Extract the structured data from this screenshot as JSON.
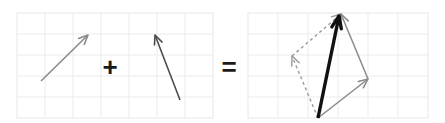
{
  "figure": {
    "background_color": "#ffffff",
    "width": 445,
    "height": 123
  },
  "style": {
    "grid_line_color": "#e8eced",
    "grid_border_color": "#e3e8ea",
    "vector_gray": "#8a8a8a",
    "vector_dark_gray": "#4d4d4d",
    "resultant_black": "#111111",
    "dashed_gray": "#9a9a9a",
    "operator_color": "#1a1a1a"
  },
  "operators": {
    "plus": {
      "label": "+",
      "x": 110,
      "y": 67,
      "font_size": 26
    },
    "equals": {
      "label": "=",
      "x": 229,
      "y": 67,
      "font_size": 26
    }
  },
  "left_panel": {
    "name": "operand-grid",
    "grid": {
      "x": 17,
      "y": 13,
      "width": 196,
      "height": 105,
      "cols": 7,
      "rows": 5,
      "cell_width": 28,
      "cell_height": 21
    },
    "vectors": [
      {
        "id": "vector-a",
        "label": "a",
        "color": "#8a8a8a",
        "stroke_width": 1.6,
        "tail": {
          "x": 41,
          "y": 81
        },
        "tip": {
          "x": 88,
          "y": 35
        },
        "components": {
          "dx": 47,
          "dy": -46
        }
      },
      {
        "id": "vector-b",
        "label": "b",
        "color": "#4d4d4d",
        "stroke_width": 1.6,
        "tail": {
          "x": 180,
          "y": 100
        },
        "tip": {
          "x": 155,
          "y": 35
        },
        "components": {
          "dx": -25,
          "dy": -65
        }
      }
    ]
  },
  "right_panel": {
    "name": "resultant-grid",
    "grid": {
      "x": 248,
      "y": 13,
      "width": 180,
      "height": 105,
      "cols": 6,
      "rows": 5,
      "cell_width": 30,
      "cell_height": 21
    },
    "origin": {
      "x": 318,
      "y": 118
    },
    "vectors": [
      {
        "id": "vector-a-solid",
        "label": "a",
        "role": "component",
        "style": "solid",
        "color": "#8a8a8a",
        "stroke_width": 1.5,
        "tail": {
          "x": 318,
          "y": 118
        },
        "tip": {
          "x": 368,
          "y": 79
        }
      },
      {
        "id": "vector-b-solid",
        "label": "b",
        "role": "component",
        "style": "solid",
        "color": "#8a8a8a",
        "stroke_width": 1.5,
        "tail": {
          "x": 368,
          "y": 79
        },
        "tip": {
          "x": 341,
          "y": 14
        }
      },
      {
        "id": "vector-b-dashed",
        "label": "b",
        "role": "translated-copy",
        "style": "dashed",
        "color": "#9a9a9a",
        "stroke_width": 1.4,
        "dash_pattern": "3 3",
        "tail": {
          "x": 318,
          "y": 118
        },
        "tip": {
          "x": 292,
          "y": 56
        }
      },
      {
        "id": "vector-a-dashed",
        "label": "a",
        "role": "translated-copy",
        "style": "dashed",
        "color": "#9a9a9a",
        "stroke_width": 1.4,
        "dash_pattern": "3 3",
        "tail": {
          "x": 292,
          "y": 56
        },
        "tip": {
          "x": 341,
          "y": 14
        }
      },
      {
        "id": "vector-resultant",
        "label": "a + b",
        "role": "resultant",
        "style": "solid-bold",
        "color": "#111111",
        "stroke_width": 3.4,
        "tail": {
          "x": 318,
          "y": 118
        },
        "tip": {
          "x": 339,
          "y": 16
        }
      }
    ]
  }
}
